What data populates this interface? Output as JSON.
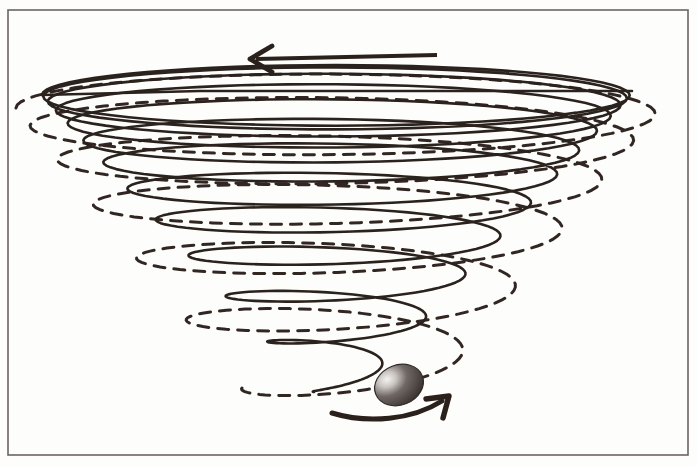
{
  "figure": {
    "title": "Gravity Well Vortex Funnel",
    "background_color": "#fdfdfc",
    "ink_color": "#2b211c",
    "frame_color": "#6b6560"
  },
  "frame": {
    "name": "border-frame",
    "x": 8,
    "y": 10,
    "width": 680,
    "height": 445,
    "stroke_width": 1.6
  },
  "chart_data": {
    "type": "line",
    "title": "Gravity Well Vortex Funnel",
    "xlabel": "",
    "ylabel": "",
    "grid": false,
    "legend": null,
    "xlim": [
      0,
      697
    ],
    "ylim": [
      0,
      467
    ],
    "annotations": [
      {
        "name": "top-direction-arrow",
        "kind": "straight-arrow",
        "direction": "left",
        "from": [
          437,
          55
        ],
        "to": [
          250,
          59
        ],
        "stroke_width": 4.2
      },
      {
        "name": "bottom-rotation-arrow",
        "kind": "curved-arrow",
        "direction": "right",
        "from": [
          332,
          413
        ],
        "to": [
          449,
          396
        ],
        "stroke_width": 5.0
      },
      {
        "name": "orbiting-ball",
        "kind": "sphere",
        "center": [
          399,
          385
        ],
        "radius_x": 25,
        "radius_y": 20,
        "rotation_deg": -22,
        "fill": "#4a4340",
        "highlight": "#efeeec"
      }
    ],
    "series": [
      {
        "name": "solid-funnel-spiral",
        "style": "solid",
        "stroke": "#2b211c",
        "stroke_width": 2.6,
        "turns": 12,
        "top_radius_x": 294,
        "top_radius_y": 30,
        "bottom_radius_x": 22,
        "bottom_radius_y": 7,
        "center_x": 336,
        "top_y": 95,
        "bottom_y": 392
      },
      {
        "name": "dashed-flow-spiral",
        "style": "dashed",
        "stroke": "#332822",
        "stroke_width": 3.0,
        "dash_pattern": "11 9",
        "turns": 6,
        "top_radius_x": 322,
        "top_radius_y": 36,
        "bottom_radius_x": 96,
        "bottom_radius_y": 22,
        "center_x": 338,
        "top_y": 108,
        "bottom_y": 388
      }
    ]
  },
  "elements": {
    "funnel_label": "solid funnel spiral",
    "flow_label": "dashed flow spiral",
    "ball_label": "orbiting ball",
    "top_arrow_label": "top direction arrow",
    "bottom_arrow_label": "bottom rotation arrow"
  }
}
